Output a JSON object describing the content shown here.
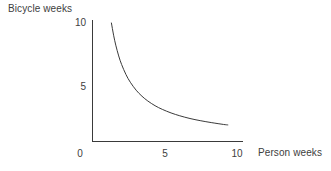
{
  "chart_data": {
    "type": "line",
    "title": "",
    "subtitle": "",
    "xlabel": "Person weeks",
    "ylabel": "Bicycle weeks",
    "xlim": [
      0,
      10.6
    ],
    "ylim": [
      0,
      11.0
    ],
    "xticks": [
      0,
      5,
      10
    ],
    "yticks": [
      5,
      10
    ],
    "xtick_labels": [
      "0",
      "5",
      "10"
    ],
    "ytick_labels": [
      "5",
      "10"
    ],
    "grid": false,
    "legend": null,
    "legend_position": "none",
    "annotations": [],
    "axis_color": "#3a3a3a",
    "curve_color": "#3a3a3a",
    "text_color": "#404040",
    "background": "#ffffff",
    "series": [
      {
        "name": "Isoquant",
        "description": "Constant-output isoquant, hyperbola x*y = 13",
        "color": "#3a3a3a",
        "x": [
          1.3,
          1.45,
          1.6,
          1.8,
          2.0,
          2.3,
          2.6,
          3.0,
          3.4,
          3.8,
          4.3,
          4.8,
          5.4,
          6.0,
          6.7,
          7.4,
          8.2,
          9.0,
          9.3
        ],
        "y": [
          10.0,
          8.97,
          8.13,
          7.22,
          6.5,
          5.65,
          5.0,
          4.33,
          3.82,
          3.42,
          3.02,
          2.71,
          2.41,
          2.17,
          1.94,
          1.76,
          1.59,
          1.44,
          1.4
        ]
      }
    ]
  },
  "labels": {
    "y_axis_title": "Bicycle weeks",
    "x_axis_title": "Person weeks",
    "y_tick_10": "10",
    "y_tick_5": "5",
    "x_tick_0": "0",
    "x_tick_5": "5",
    "x_tick_10": "10"
  }
}
